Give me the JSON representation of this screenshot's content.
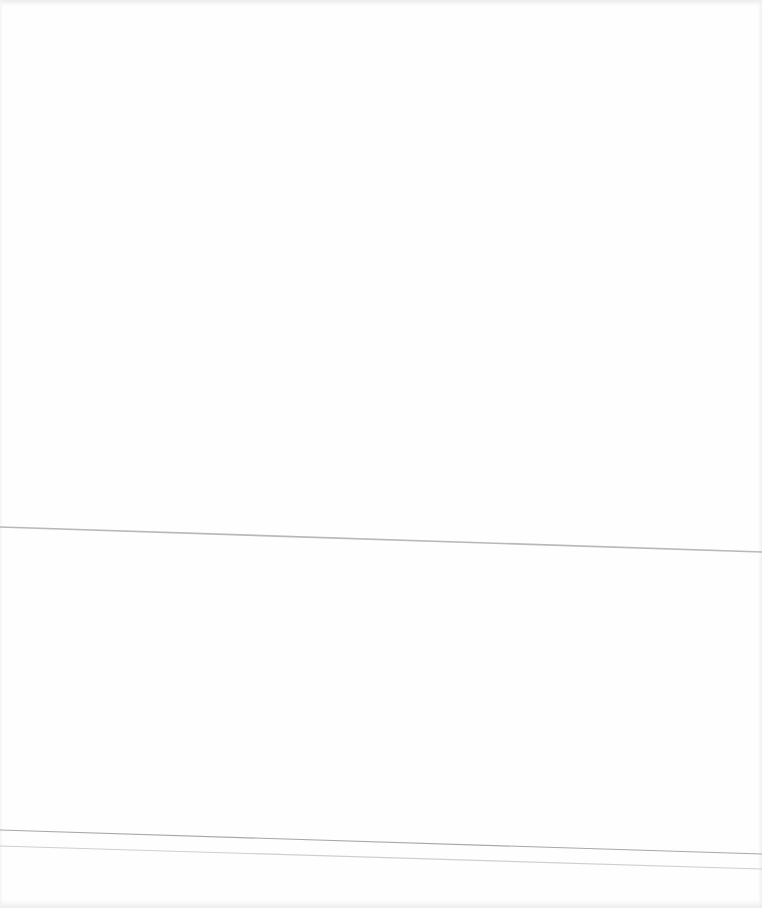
{
  "page": {
    "background_color": "#fefefe",
    "content_text": ""
  },
  "lines": [
    {
      "name": "fold-line-1",
      "x1": 0,
      "y1": 527,
      "x2": 762,
      "y2": 552,
      "color": "#b8b8b8",
      "width": 1.6
    },
    {
      "name": "fold-line-2",
      "x1": 0,
      "y1": 830,
      "x2": 762,
      "y2": 854,
      "color": "#a8a8a8",
      "width": 1.2
    },
    {
      "name": "fold-line-3",
      "x1": 0,
      "y1": 846,
      "x2": 762,
      "y2": 869,
      "color": "#cfcfcf",
      "width": 1.2
    }
  ]
}
